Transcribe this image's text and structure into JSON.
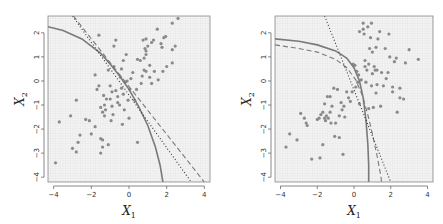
{
  "chart_data": [
    {
      "type": "scatter",
      "panel": "left",
      "xlabel": "X_1",
      "ylabel": "X_2",
      "xlim": [
        -4.3,
        4.3
      ],
      "ylim": [
        -4.2,
        2.7
      ],
      "xticks": [
        -4,
        -2,
        0,
        2,
        4
      ],
      "yticks": [
        -4,
        -3,
        -2,
        -1,
        0,
        1,
        2
      ],
      "grid": "fine background grid",
      "box": {
        "left": 48,
        "top": 16,
        "right": 210,
        "bottom": 182
      },
      "points": [
        [
          -3.9,
          -3.4
        ],
        [
          -3.7,
          -1.7
        ],
        [
          -3.1,
          -1.45
        ],
        [
          -3.0,
          -2.8
        ],
        [
          -2.8,
          -0.8
        ],
        [
          -2.8,
          -2.95
        ],
        [
          -2.7,
          -2.55
        ],
        [
          -2.6,
          -2.25
        ],
        [
          -2.3,
          -1.6
        ],
        [
          -2.1,
          -1.65
        ],
        [
          -2.0,
          -2.2
        ],
        [
          -1.8,
          -1.9
        ],
        [
          -1.8,
          0.25
        ],
        [
          -1.7,
          -0.35
        ],
        [
          -1.6,
          -0.2
        ],
        [
          -1.6,
          1.9
        ],
        [
          -1.5,
          -2.4
        ],
        [
          -1.5,
          -3.0
        ],
        [
          -1.4,
          -2.45
        ],
        [
          -1.4,
          -2.75
        ],
        [
          -1.5,
          -1.1
        ],
        [
          -1.4,
          -1.3
        ],
        [
          -1.35,
          -0.6
        ],
        [
          -1.3,
          -1.0
        ],
        [
          -1.3,
          -1.45
        ],
        [
          -1.25,
          -1.2
        ],
        [
          -1.2,
          -0.75
        ],
        [
          -1.1,
          -2.65
        ],
        [
          -1.1,
          0.45
        ],
        [
          -1.0,
          -0.2
        ],
        [
          -1.0,
          -0.75
        ],
        [
          -0.95,
          -1.65
        ],
        [
          -0.9,
          -0.45
        ],
        [
          -0.9,
          -1.05
        ],
        [
          -0.85,
          -1.4
        ],
        [
          -0.8,
          0.6
        ],
        [
          -0.8,
          1.45
        ],
        [
          -0.7,
          -0.4
        ],
        [
          -0.7,
          1.7
        ],
        [
          -0.6,
          -0.9
        ],
        [
          -0.6,
          -0.65
        ],
        [
          -0.5,
          -1.0
        ],
        [
          -0.45,
          0.15
        ],
        [
          -0.4,
          0.5
        ],
        [
          -0.4,
          -0.3
        ],
        [
          -0.35,
          -1.8
        ],
        [
          -0.3,
          -0.55
        ],
        [
          -0.3,
          0.85
        ],
        [
          -0.25,
          -1.2
        ],
        [
          -0.2,
          -0.05
        ],
        [
          -0.15,
          1.1
        ],
        [
          -0.1,
          0.0
        ],
        [
          -0.05,
          -0.8
        ],
        [
          0.0,
          -1.55
        ],
        [
          0.05,
          -0.35
        ],
        [
          0.1,
          0.1
        ],
        [
          0.2,
          0.35
        ],
        [
          0.3,
          -0.8
        ],
        [
          0.4,
          -0.35
        ],
        [
          0.45,
          0.9
        ],
        [
          0.45,
          -2.55
        ],
        [
          0.6,
          0.85
        ],
        [
          0.65,
          -0.1
        ],
        [
          0.7,
          0.2
        ],
        [
          0.75,
          1.7
        ],
        [
          0.8,
          0.45
        ],
        [
          0.8,
          0.95
        ],
        [
          0.85,
          1.35
        ],
        [
          0.9,
          1.1
        ],
        [
          0.9,
          1.25
        ],
        [
          0.9,
          1.75
        ],
        [
          0.9,
          0.4
        ],
        [
          1.0,
          1.45
        ],
        [
          1.1,
          0.15
        ],
        [
          1.1,
          0.65
        ],
        [
          1.2,
          -0.1
        ],
        [
          1.2,
          1.6
        ],
        [
          1.3,
          1.7
        ],
        [
          1.35,
          0.4
        ],
        [
          1.5,
          2.15
        ],
        [
          1.55,
          0.05
        ],
        [
          1.7,
          1.55
        ],
        [
          1.75,
          1.4
        ],
        [
          1.8,
          0.4
        ],
        [
          1.85,
          1.8
        ],
        [
          1.95,
          1.85
        ],
        [
          2.0,
          0.6
        ],
        [
          2.3,
          0.75
        ],
        [
          2.3,
          1.3
        ],
        [
          2.3,
          2.4
        ],
        [
          2.45,
          1.45
        ],
        [
          2.6,
          2.6
        ]
      ],
      "curves": [
        {
          "name": "solid",
          "style": "solid",
          "points": [
            [
              -4.3,
              2.25
            ],
            [
              -3.5,
              2.1
            ],
            [
              -2.5,
              1.75
            ],
            [
              -1.5,
              1.15
            ],
            [
              -1.0,
              0.7
            ],
            [
              -0.5,
              0.2
            ],
            [
              0.0,
              -0.35
            ],
            [
              0.5,
              -1.05
            ],
            [
              1.0,
              -1.85
            ],
            [
              1.4,
              -2.75
            ],
            [
              1.65,
              -3.5
            ],
            [
              1.8,
              -4.2
            ]
          ]
        },
        {
          "name": "dashed",
          "style": "dashed",
          "points": [
            [
              -2.95,
              2.7
            ],
            [
              4.0,
              -4.2
            ]
          ]
        },
        {
          "name": "dotted",
          "style": "dotted",
          "points": [
            [
              -3.0,
              2.7
            ],
            [
              3.3,
              -4.2
            ]
          ]
        }
      ]
    },
    {
      "type": "scatter",
      "panel": "right",
      "xlabel": "X_1",
      "ylabel": "X_2",
      "xlim": [
        -4.3,
        4.3
      ],
      "ylim": [
        -4.2,
        2.7
      ],
      "xticks": [
        -4,
        -2,
        0,
        2,
        4
      ],
      "yticks": [
        -4,
        -3,
        -2,
        -1,
        0,
        1,
        2
      ],
      "grid": "fine background grid",
      "box": {
        "left": 275,
        "top": 16,
        "right": 433,
        "bottom": 182
      },
      "points": [
        [
          -3.7,
          -2.75
        ],
        [
          -3.5,
          -2.2
        ],
        [
          -3.1,
          -2.45
        ],
        [
          -2.9,
          -1.35
        ],
        [
          -2.7,
          -1.55
        ],
        [
          -2.6,
          -1.75
        ],
        [
          -2.55,
          -1.85
        ],
        [
          -2.3,
          -3.25
        ],
        [
          -2.0,
          -1.6
        ],
        [
          -1.9,
          -1.55
        ],
        [
          -1.85,
          -3.2
        ],
        [
          -1.8,
          -1.4
        ],
        [
          -1.7,
          -1.3
        ],
        [
          -1.7,
          -2.65
        ],
        [
          -1.6,
          -1.55
        ],
        [
          -1.6,
          -0.95
        ],
        [
          -1.55,
          -1.65
        ],
        [
          -1.5,
          -1.45
        ],
        [
          -1.45,
          -0.65
        ],
        [
          -1.4,
          -1.55
        ],
        [
          -1.3,
          -0.65
        ],
        [
          -1.3,
          -1.3
        ],
        [
          -1.25,
          -1.75
        ],
        [
          -1.2,
          -1.05
        ],
        [
          -1.1,
          -0.3
        ],
        [
          -1.05,
          -2.3
        ],
        [
          -1.0,
          -1.75
        ],
        [
          -0.9,
          -0.35
        ],
        [
          -0.8,
          -1.45
        ],
        [
          -0.8,
          -2.35
        ],
        [
          -0.7,
          -0.9
        ],
        [
          -0.65,
          -1.2
        ],
        [
          -0.6,
          -3.05
        ],
        [
          -0.55,
          -1.05
        ],
        [
          -0.5,
          -1.5
        ],
        [
          -0.4,
          -0.45
        ],
        [
          -0.3,
          -0.7
        ],
        [
          -0.2,
          -0.85
        ],
        [
          -0.1,
          -0.45
        ],
        [
          -0.05,
          0.7
        ],
        [
          0.05,
          0.65
        ],
        [
          0.1,
          -0.25
        ],
        [
          0.15,
          0.4
        ],
        [
          0.2,
          -0.05
        ],
        [
          0.25,
          0.25
        ],
        [
          0.3,
          -0.95
        ],
        [
          0.3,
          2.05
        ],
        [
          0.4,
          0.05
        ],
        [
          0.5,
          2.4
        ],
        [
          0.5,
          2.15
        ],
        [
          0.55,
          1.95
        ],
        [
          0.6,
          0.6
        ],
        [
          0.6,
          0.85
        ],
        [
          0.65,
          -0.05
        ],
        [
          0.7,
          0.45
        ],
        [
          0.75,
          2.25
        ],
        [
          0.8,
          0.7
        ],
        [
          0.8,
          -1.15
        ],
        [
          0.85,
          1.35
        ],
        [
          0.9,
          1.8
        ],
        [
          0.95,
          2.4
        ],
        [
          0.95,
          -0.2
        ],
        [
          1.0,
          0.3
        ],
        [
          1.0,
          1.2
        ],
        [
          1.05,
          -1.1
        ],
        [
          1.1,
          0.6
        ],
        [
          1.15,
          0.45
        ],
        [
          1.2,
          -0.5
        ],
        [
          1.2,
          1.4
        ],
        [
          1.25,
          0.45
        ],
        [
          1.25,
          -0.15
        ],
        [
          1.3,
          1.75
        ],
        [
          1.4,
          2.05
        ],
        [
          1.45,
          -1.05
        ],
        [
          1.5,
          0.35
        ],
        [
          1.6,
          -0.2
        ],
        [
          1.7,
          1.35
        ],
        [
          1.75,
          0.1
        ],
        [
          1.85,
          0.35
        ],
        [
          1.9,
          1.95
        ],
        [
          1.95,
          1.0
        ],
        [
          2.1,
          -0.45
        ],
        [
          2.1,
          -0.25
        ],
        [
          2.2,
          0.8
        ],
        [
          2.3,
          0.95
        ],
        [
          2.35,
          -1.3
        ],
        [
          2.5,
          -0.7
        ],
        [
          2.5,
          -0.3
        ],
        [
          2.7,
          -0.75
        ],
        [
          2.8,
          0.75
        ],
        [
          3.0,
          1.3
        ],
        [
          3.5,
          0.9
        ]
      ],
      "curves": [
        {
          "name": "solid",
          "style": "solid",
          "points": [
            [
              -4.3,
              1.75
            ],
            [
              -3.0,
              1.65
            ],
            [
              -2.0,
              1.5
            ],
            [
              -1.0,
              1.25
            ],
            [
              -0.4,
              0.95
            ],
            [
              0.0,
              0.55
            ],
            [
              0.3,
              0.0
            ],
            [
              0.5,
              -0.7
            ],
            [
              0.65,
              -1.6
            ],
            [
              0.75,
              -2.6
            ],
            [
              0.8,
              -3.5
            ],
            [
              0.8,
              -4.2
            ]
          ]
        },
        {
          "name": "dashed",
          "style": "dashed",
          "points": [
            [
              -4.3,
              1.5
            ],
            [
              -3.0,
              1.35
            ],
            [
              -2.0,
              1.2
            ],
            [
              -1.0,
              0.9
            ],
            [
              -0.4,
              0.55
            ],
            [
              0.1,
              0.05
            ],
            [
              0.45,
              -0.6
            ],
            [
              0.75,
              -1.4
            ],
            [
              1.0,
              -2.2
            ],
            [
              1.25,
              -3.1
            ],
            [
              1.45,
              -3.9
            ],
            [
              1.5,
              -4.2
            ]
          ]
        },
        {
          "name": "dotted",
          "style": "dotted",
          "points": [
            [
              -1.6,
              2.7
            ],
            [
              2.0,
              -4.2
            ]
          ]
        }
      ]
    }
  ],
  "style": {
    "point_color": "#8a8a8a",
    "curve_color": "#7a7a7a",
    "line_color": "#333333",
    "panel_bg": "#f4f4f4",
    "grid_color": "#e2e2e2",
    "box_color": "#888888"
  },
  "labels": {
    "x_main": "X",
    "x_sub": "1",
    "y_main": "X",
    "y_sub": "2"
  }
}
